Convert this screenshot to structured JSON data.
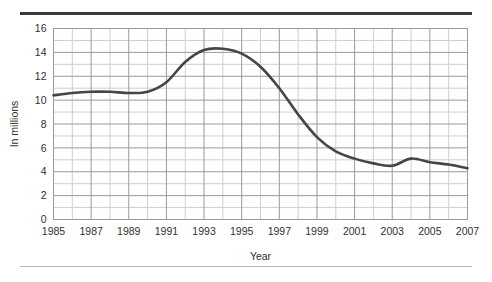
{
  "chart_data": {
    "type": "line",
    "title": "",
    "xlabel": "Year",
    "ylabel": "In millions",
    "x": [
      1985,
      1986,
      1987,
      1988,
      1989,
      1990,
      1991,
      1992,
      1993,
      1994,
      1995,
      1996,
      1997,
      1998,
      1999,
      2000,
      2001,
      2002,
      2003,
      2004,
      2005,
      2006,
      2007
    ],
    "values": [
      10.4,
      10.6,
      10.7,
      10.7,
      10.6,
      10.7,
      11.5,
      13.2,
      14.2,
      14.3,
      13.9,
      12.8,
      11.0,
      8.8,
      6.9,
      5.7,
      5.1,
      4.7,
      4.5,
      5.1,
      4.8,
      4.6,
      4.3
    ],
    "series": [
      {
        "name": "In millions",
        "values": [
          10.4,
          10.6,
          10.7,
          10.7,
          10.6,
          10.7,
          11.5,
          13.2,
          14.2,
          14.3,
          13.9,
          12.8,
          11.0,
          8.8,
          6.9,
          5.7,
          5.1,
          4.7,
          4.5,
          5.1,
          4.8,
          4.6,
          4.3
        ]
      }
    ],
    "xlim": [
      1985,
      2007
    ],
    "ylim": [
      0,
      16
    ],
    "xticks": [
      1985,
      1987,
      1989,
      1991,
      1993,
      1995,
      1997,
      1999,
      2001,
      2003,
      2005,
      2007
    ],
    "xtick_labels": [
      "1985",
      "1987",
      "1989",
      "1991",
      "1993",
      "1995",
      "1997",
      "1999",
      "2001",
      "2003",
      "2005",
      "2007"
    ],
    "x_minor_step": 1,
    "yticks": [
      0,
      2,
      4,
      6,
      8,
      10,
      12,
      14,
      16
    ],
    "ytick_labels": [
      "0",
      "2",
      "4",
      "6",
      "8",
      "10",
      "12",
      "14",
      "16"
    ],
    "y_minor_step": 1,
    "grid": true,
    "grid_major_color": "#9a9a9e",
    "grid_minor_color": "#cfcfd3",
    "line_color": "#44444a",
    "line_width": 2.6,
    "legend": false,
    "legend_position": "none",
    "markers": false,
    "annotations": []
  },
  "decorations": {
    "top_rule_color": "#3a3a3c",
    "bottom_rule_color": "#b9b9bb"
  }
}
